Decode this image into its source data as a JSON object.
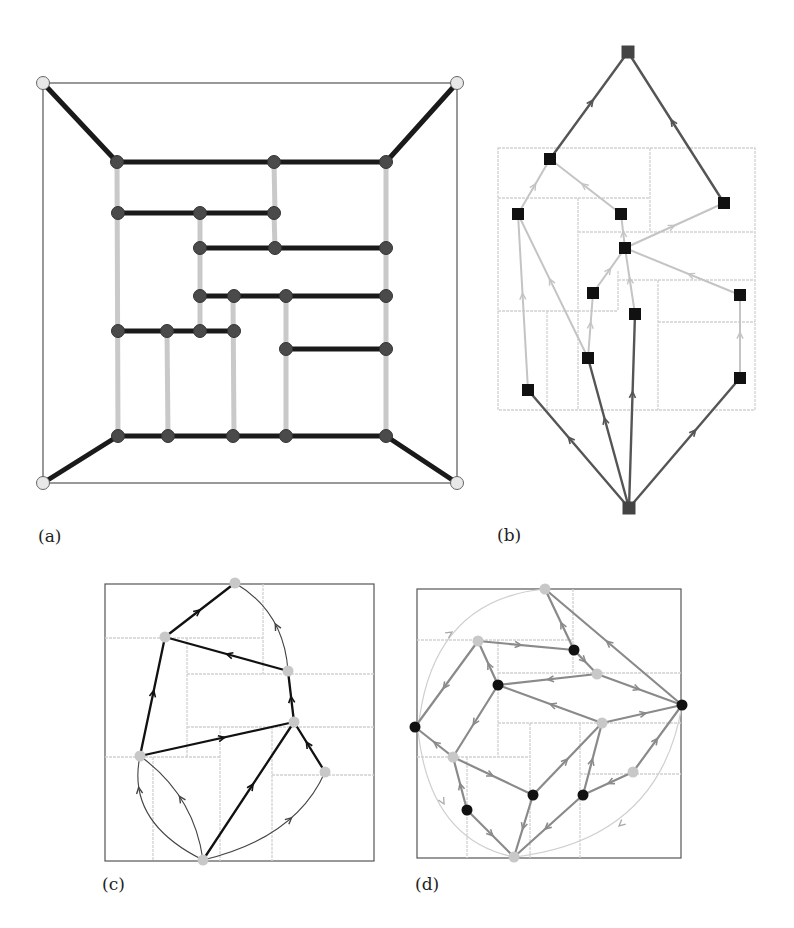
{
  "figure": {
    "panels": [
      {
        "id": "a",
        "label": "(a)",
        "description": "Rectangular dual layout: horizontal black segments and vertical grey segments with round dark vertices; four light corner vertices on the outer square"
      },
      {
        "id": "b",
        "label": "(b)",
        "description": "Directed tree-like graph of square nodes over a light-grey rectangular dissection, with source at bottom and sink at top"
      },
      {
        "id": "c",
        "label": "(c)",
        "description": "Directed graph with light round vertices over a rectangular dissection; black straight edges and thin curved edges with arrowheads"
      },
      {
        "id": "d",
        "label": "(d)",
        "description": "Directed graph with black and light round vertices over a rectangular dissection, with a light outer circular arc"
      }
    ]
  },
  "colors": {
    "black_edge": "#111111",
    "grey_edge": "#c8c8c8",
    "dark_node": "#4a4a4a",
    "light_node": "#e6e6e6",
    "square_node": "#111111",
    "terminal_square": "#444444",
    "dark_arrow_edge": "#555555",
    "light_arrow_edge": "#c4c4c4",
    "mid_grey_edge": "#8a8a8a",
    "dissection_line": "#d0d0d0",
    "frame": "#555555"
  }
}
